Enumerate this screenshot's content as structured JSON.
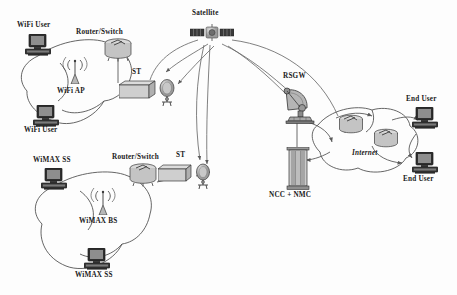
{
  "diagram": {
    "background_color": "#fdfdfd",
    "line_color": "#4a4a4a"
  },
  "labels": {
    "satellite": "Satellite",
    "wifi_user_top": "WiFi User",
    "wifi_user_bottom": "WiFi User",
    "wifi_ap": "WiFi AP",
    "router_switch_wifi": "Router/Switch",
    "st_wifi": "ST",
    "wimax_ss_top": "WiMAX SS",
    "wimax_ss_bottom": "WiMAX SS",
    "wimax_bs": "WiMAX BS",
    "router_switch_wimax": "Router/Switch",
    "st_wimax": "ST",
    "rsgw": "RSGW",
    "ncc_nmc": "NCC + NMC",
    "internet": "Internet",
    "end_user_top": "End User",
    "end_user_bottom": "End User"
  },
  "nodes": [
    {
      "id": "satellite",
      "icon": "satellite-icon",
      "label": "Satellite",
      "x": 211,
      "y": 34
    },
    {
      "id": "wifi-user-top",
      "icon": "computer-icon",
      "label": "WiFi User",
      "x": 37,
      "y": 45
    },
    {
      "id": "wifi-user-bottom",
      "icon": "computer-icon",
      "label": "WiFi User",
      "x": 44,
      "y": 115
    },
    {
      "id": "wifi-ap",
      "icon": "antenna-icon",
      "label": "WiFi AP",
      "x": 73,
      "y": 72
    },
    {
      "id": "router-switch-wifi",
      "icon": "router-icon",
      "label": "Router/Switch",
      "x": 102,
      "y": 47
    },
    {
      "id": "st-wifi",
      "icon": "terminal-dish-icon",
      "label": "ST",
      "x": 140,
      "y": 86
    },
    {
      "id": "wimax-ss-top",
      "icon": "computer-icon",
      "label": "WiMAX SS",
      "x": 53,
      "y": 178
    },
    {
      "id": "wimax-ss-bottom",
      "icon": "computer-icon",
      "label": "WiMAX SS",
      "x": 96,
      "y": 258
    },
    {
      "id": "wimax-bs",
      "icon": "antenna-icon",
      "label": "WiMAX BS",
      "x": 102,
      "y": 203
    },
    {
      "id": "router-switch-wimax",
      "icon": "router-icon",
      "label": "Router/Switch",
      "x": 141,
      "y": 172
    },
    {
      "id": "st-wimax",
      "icon": "terminal-dish-icon",
      "label": "ST",
      "x": 182,
      "y": 170
    },
    {
      "id": "rsgw",
      "icon": "ground-station-icon",
      "label": "RSGW",
      "x": 297,
      "y": 103
    },
    {
      "id": "ncc-nmc",
      "icon": "server-rack-icon",
      "label": "NCC + NMC",
      "x": 297,
      "y": 167
    },
    {
      "id": "internet-router-a",
      "icon": "router-icon",
      "label": "",
      "x": 351,
      "y": 125
    },
    {
      "id": "internet-router-b",
      "icon": "router-icon",
      "label": "",
      "x": 385,
      "y": 139
    },
    {
      "id": "end-user-top",
      "icon": "computer-icon",
      "label": "End User",
      "x": 424,
      "y": 118
    },
    {
      "id": "end-user-bottom",
      "icon": "computer-icon",
      "label": "End User",
      "x": 424,
      "y": 162
    }
  ],
  "clouds": [
    {
      "id": "wifi-cloud",
      "label": ""
    },
    {
      "id": "wimax-cloud",
      "label": ""
    },
    {
      "id": "internet-cloud",
      "label": "Internet"
    }
  ],
  "links": [
    {
      "from": "satellite",
      "to": "st-wifi",
      "type": "beam"
    },
    {
      "from": "satellite",
      "to": "st-wimax",
      "type": "beam"
    },
    {
      "from": "satellite",
      "to": "rsgw",
      "type": "beam"
    },
    {
      "from": "rsgw",
      "to": "ncc-nmc",
      "type": "link"
    },
    {
      "from": "rsgw",
      "to": "internet-cloud",
      "type": "link"
    },
    {
      "from": "internet-cloud",
      "to": "ncc-nmc",
      "type": "link"
    },
    {
      "from": "internet-cloud",
      "to": "end-user-top",
      "type": "link"
    },
    {
      "from": "internet-cloud",
      "to": "end-user-bottom",
      "type": "link"
    },
    {
      "from": "router-switch-wifi",
      "to": "st-wifi",
      "type": "link"
    },
    {
      "from": "router-switch-wimax",
      "to": "st-wimax",
      "type": "link"
    }
  ]
}
